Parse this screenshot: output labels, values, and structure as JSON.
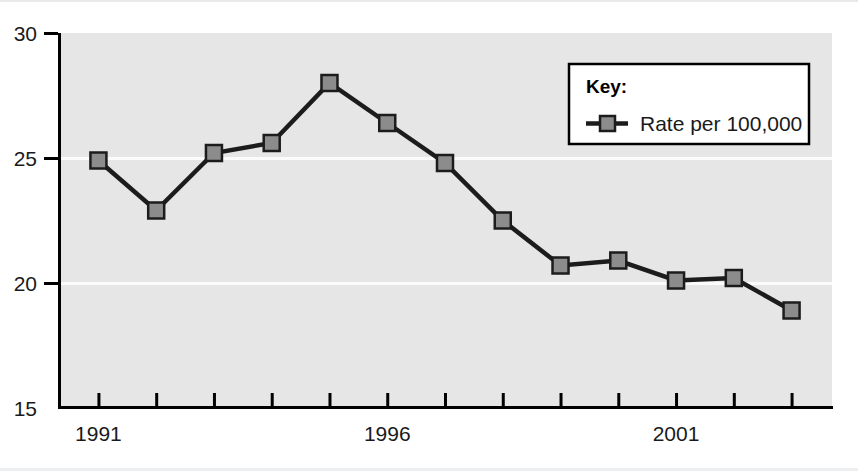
{
  "chart_data": {
    "type": "line",
    "title": "",
    "xlabel": "",
    "ylabel": "",
    "x": [
      1991,
      1992,
      1993,
      1994,
      1995,
      1996,
      1997,
      1998,
      1999,
      2000,
      2001,
      2002,
      2003
    ],
    "xtick_values": [
      1991,
      1992,
      1993,
      1994,
      1995,
      1996,
      1997,
      1998,
      1999,
      2000,
      2001,
      2002,
      2003
    ],
    "xtick_labels_shown": [
      "1991",
      "1996",
      "2001"
    ],
    "xtick_labeled_values": [
      1991,
      1996,
      2001
    ],
    "xlim": [
      1990.3,
      2003.7
    ],
    "ylim": [
      15,
      30
    ],
    "ytick_values": [
      15,
      20,
      25,
      30
    ],
    "ytick_labels": [
      "15",
      "20",
      "25",
      "30"
    ],
    "grid": true,
    "gridline_values": [
      20,
      25
    ],
    "legend_position": "upper-right-inside",
    "series": [
      {
        "name": "Rate per 100,000",
        "marker": "square",
        "values": [
          24.9,
          22.9,
          25.2,
          25.6,
          28.0,
          26.4,
          24.8,
          22.5,
          20.7,
          20.9,
          20.1,
          20.2,
          18.9
        ]
      }
    ]
  },
  "legend": {
    "title": "Key:",
    "entries": [
      {
        "label": "Rate per 100,000"
      }
    ]
  },
  "axes": {
    "y_labels": [
      "30",
      "25",
      "20",
      "15"
    ],
    "x_labels": [
      "1991",
      "1996",
      "2001"
    ]
  },
  "colors": {
    "plot_background": "#e6e6e6",
    "line": "#1c1c1c",
    "marker_fill": "#8c8c8c",
    "marker_edge": "#1c1c1c",
    "axis": "#000000",
    "gridline": "#fbfbfb",
    "legend_background": "#ffffff",
    "legend_border": "#000000",
    "text": "#1a1a1a"
  }
}
